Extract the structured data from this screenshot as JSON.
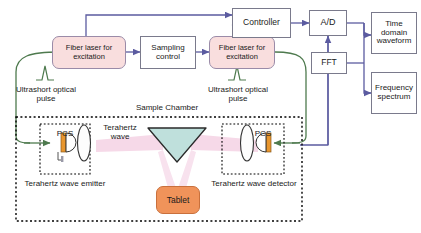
{
  "diagram": {
    "colors": {
      "laser_box_fill": "#f9dede",
      "laser_box_border": "#9a8ba8",
      "wire_blue": "#5b5ba0",
      "fiber_green": "#4e7a4e",
      "thz_beam_pink": "#f6d9e8",
      "prism_fill": "#bfe0dc",
      "tablet_fill": "#f0935a",
      "pcs_bar": "#e8962e",
      "box_border": "#7a7a8c",
      "chamber_border": "#000000"
    },
    "blocks": {
      "fiber_laser_left": "Fiber laser for excitation",
      "fiber_laser_right": "Fiber laser for excitation",
      "sampling_control": "Sampling control",
      "controller": "Controller",
      "ad_converter": "A/D",
      "fft": "FFT",
      "time_domain": "Time domain waveform",
      "frequency_spectrum": "Frequency spectrum"
    },
    "labels": {
      "pulse_left": "Ultrashort optical pulse",
      "pulse_right": "Ultrashort optical pulse",
      "sample_chamber": "Sample Chamber",
      "terahertz_wave": "Terahertz wave",
      "emitter": "Terahertz wave emitter",
      "detector": "Terahertz wave detector",
      "pcs_left": "PCS",
      "pcs_right": "PCS",
      "tablet": "Tablet"
    }
  }
}
